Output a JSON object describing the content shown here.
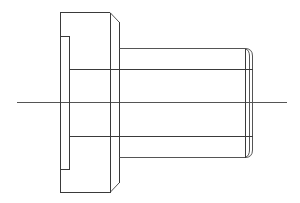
{
  "drawing": {
    "type": "orthographic-side-view",
    "subject": "flanged cylindrical bushing",
    "line_color": "#3a3a3a",
    "background": "#ffffff",
    "centerline": {
      "x1": 17,
      "y": 102,
      "x2": 287
    },
    "flange": {
      "left": 60,
      "top": 12,
      "right": 110,
      "bottom": 192,
      "chamfer_to_x": 119,
      "chamfer_top_y": 22,
      "chamfer_bottom_y": 183
    },
    "slot": {
      "left": 60,
      "right": 69,
      "top": 36,
      "bottom": 169
    },
    "shaft": {
      "left": 119,
      "top": 48,
      "bottom": 157,
      "end_x": 246,
      "rounded_end_x": 253
    },
    "bore_lines": {
      "y_top": 69,
      "y_bottom": 136,
      "x_start": 69,
      "x_end": 253
    },
    "end_verticals": [
      246,
      249,
      253
    ]
  }
}
